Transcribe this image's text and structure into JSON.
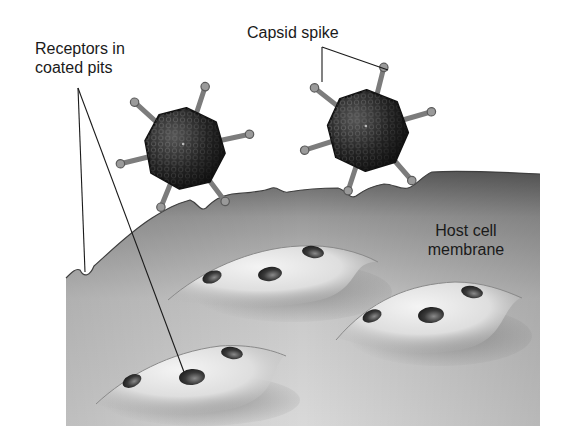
{
  "figure": {
    "labels": {
      "receptors": {
        "line1": "Receptors in",
        "line2": "coated pits"
      },
      "capsid_spike": "Capsid spike",
      "host_membrane": {
        "line1": "Host cell",
        "line2": "membrane"
      }
    },
    "elements": {
      "viruses": [
        {
          "name": "virus-left",
          "cx": 185,
          "cy": 148,
          "r": 38
        },
        {
          "name": "virus-right",
          "cx": 368,
          "cy": 130,
          "r": 38
        }
      ],
      "coated_pits": [
        {
          "name": "coated-pit-upper",
          "cx": 282,
          "cy": 272
        },
        {
          "name": "coated-pit-right",
          "cx": 438,
          "cy": 318
        },
        {
          "name": "coated-pit-lower",
          "cx": 205,
          "cy": 380
        }
      ]
    },
    "colors": {
      "background": "#ffffff",
      "membrane_light": "#e6e6e6",
      "membrane_dark": "#6e6e6e",
      "capsid": "#1e1e1e",
      "spike": "#8a8a8a",
      "receptor": "#2e2e2e",
      "text": "#1a1a1a"
    }
  }
}
